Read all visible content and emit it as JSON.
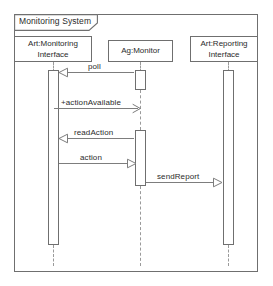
{
  "diagram": {
    "type": "uml-sequence-diagram",
    "frame": {
      "label": "Monitoring System"
    },
    "lifelines": [
      {
        "id": "monitoring-interface",
        "label": "Art:Monitoring\nInterface",
        "center_x": 53
      },
      {
        "id": "monitor-agent",
        "label": "Ag:Monitor",
        "center_x": 140
      },
      {
        "id": "reporting-interface",
        "label": "Art:Reporting\nInterface",
        "center_x": 228
      }
    ],
    "messages": [
      {
        "id": "poll",
        "label": "poll",
        "from": "monitor-agent",
        "to": "monitoring-interface",
        "direction": "left",
        "arrow": "hollow-triangle",
        "y": 72
      },
      {
        "id": "action-available",
        "label": "+actionAvailable",
        "from": "monitoring-interface",
        "to": "monitor-agent",
        "direction": "right",
        "arrow": "open-line",
        "y": 108
      },
      {
        "id": "read-action",
        "label": "readAction",
        "from": "monitor-agent",
        "to": "monitoring-interface",
        "direction": "left",
        "arrow": "hollow-triangle",
        "y": 138
      },
      {
        "id": "action",
        "label": "action",
        "from": "monitoring-interface",
        "to": "monitor-agent",
        "direction": "right",
        "arrow": "hollow-triangle",
        "y": 163
      },
      {
        "id": "send-report",
        "label": "sendReport",
        "from": "monitor-agent",
        "to": "reporting-interface",
        "direction": "right",
        "arrow": "hollow-triangle",
        "y": 182
      }
    ],
    "colors": {
      "stroke": "#6f6f6f",
      "line": "#7d7d7d",
      "dashed": "#9a9a9a",
      "text": "#2b2b2b",
      "background": "#ffffff"
    }
  }
}
